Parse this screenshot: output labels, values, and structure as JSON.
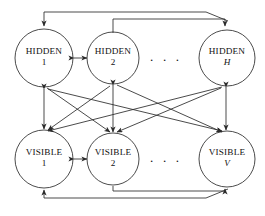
{
  "diagram": {
    "stroke_color": "#2b2b2b",
    "background": "#ffffff",
    "ellipsis_text": ". . .",
    "layers": [
      {
        "name": "hidden",
        "nodes": [
          {
            "id": "hidden-1",
            "title": "HIDDEN",
            "index": "1",
            "index_italic": false,
            "cx": 44,
            "cy": 58,
            "r": 29
          },
          {
            "id": "hidden-2",
            "title": "HIDDEN",
            "index": "2",
            "index_italic": false,
            "cx": 113,
            "cy": 58,
            "r": 26
          },
          {
            "id": "hidden-h",
            "title": "HIDDEN",
            "index": "H",
            "index_italic": true,
            "cx": 227,
            "cy": 58,
            "r": 28
          }
        ],
        "ellipsis": {
          "x": 150,
          "y": 50
        }
      },
      {
        "name": "visible",
        "nodes": [
          {
            "id": "visible-1",
            "title": "VISIBLE",
            "index": "1",
            "index_italic": false,
            "cx": 44,
            "cy": 159,
            "r": 29
          },
          {
            "id": "visible-2",
            "title": "VISIBLE",
            "index": "2",
            "index_italic": false,
            "cx": 113,
            "cy": 159,
            "r": 26
          },
          {
            "id": "visible-v",
            "title": "VISIBLE",
            "index": "V",
            "index_italic": true,
            "cx": 227,
            "cy": 159,
            "r": 28
          }
        ],
        "ellipsis": {
          "x": 150,
          "y": 151
        }
      }
    ],
    "connections": {
      "vertical_pairs": [
        {
          "from": "hidden-1",
          "to": "visible-1"
        },
        {
          "from": "hidden-2",
          "to": "visible-2"
        },
        {
          "from": "hidden-h",
          "to": "visible-v"
        }
      ],
      "diagonal_pairs": [
        {
          "from": "hidden-1",
          "to": "visible-2"
        },
        {
          "from": "hidden-1",
          "to": "visible-v"
        },
        {
          "from": "hidden-2",
          "to": "visible-1"
        },
        {
          "from": "hidden-2",
          "to": "visible-v"
        },
        {
          "from": "hidden-h",
          "to": "visible-1"
        },
        {
          "from": "hidden-h",
          "to": "visible-2"
        }
      ],
      "lateral_pairs": [
        {
          "from": "hidden-1",
          "to": "hidden-2"
        },
        {
          "from": "visible-1",
          "to": "visible-2"
        }
      ],
      "feedback_rails": [
        {
          "id": "top-rail-outer",
          "description": "top rail into hidden-1"
        },
        {
          "id": "top-rail-inner",
          "description": "top rail into hidden-H"
        },
        {
          "id": "bottom-rail-outer",
          "description": "bottom rail into visible-1"
        },
        {
          "id": "bottom-rail-inner",
          "description": "bottom rail into visible-V"
        }
      ]
    }
  }
}
